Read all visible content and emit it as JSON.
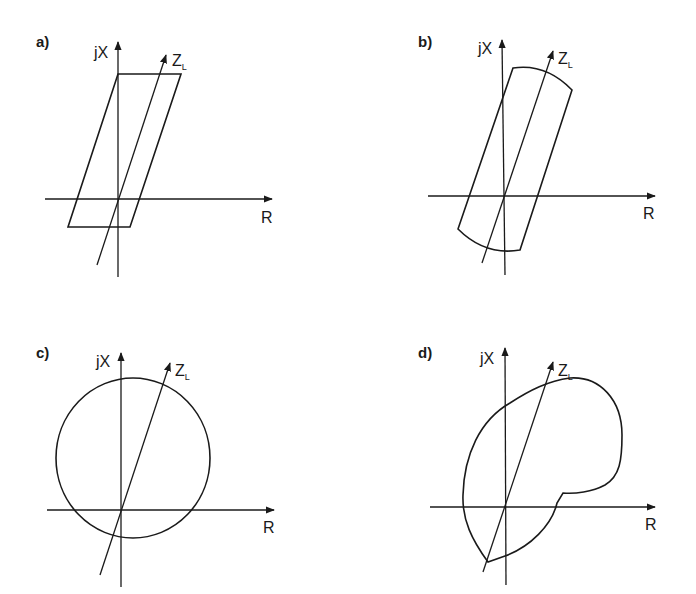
{
  "panels": [
    {
      "id": "a",
      "label": "a)",
      "y_axis_label": "jX",
      "x_axis_label": "R",
      "line_label": "Z",
      "line_label_sub": "L",
      "shape": "parallelogram (quadrilateral characteristic)"
    },
    {
      "id": "b",
      "label": "b)",
      "y_axis_label": "jX",
      "x_axis_label": "R",
      "line_label": "Z",
      "line_label_sub": "L",
      "shape": "lens / blinder with arc ends"
    },
    {
      "id": "c",
      "label": "c)",
      "y_axis_label": "jX",
      "x_axis_label": "R",
      "line_label": "Z",
      "line_label_sub": "L",
      "shape": "offset circle (mho characteristic)"
    },
    {
      "id": "d",
      "label": "d)",
      "y_axis_label": "jX",
      "x_axis_label": "R",
      "line_label": "Z",
      "line_label_sub": "L",
      "shape": "irregular polar characteristic"
    }
  ],
  "colors": {
    "stroke": "#1a1a1a",
    "background": "#ffffff"
  }
}
